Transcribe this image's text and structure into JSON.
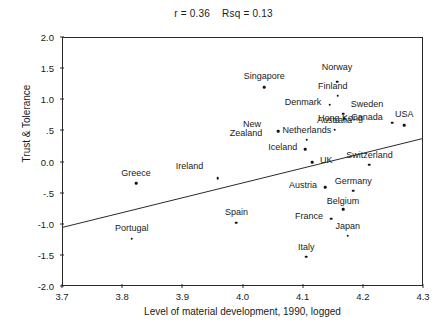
{
  "chart_data": {
    "type": "scatter",
    "title": "r = 0.36    Rsq = 0.13",
    "xlabel": "Level of material development, 1990, logged",
    "ylabel": "Trust & Tolerance",
    "xlim": [
      3.7,
      4.3
    ],
    "ylim": [
      -2.0,
      2.0
    ],
    "xticks": [
      "3.7",
      "3.8",
      "3.9",
      "4.0",
      "4.1",
      "4.2",
      "4.3"
    ],
    "xtick_values": [
      3.7,
      3.8,
      3.9,
      4.0,
      4.1,
      4.2,
      4.3
    ],
    "yticks": [
      "2.0",
      "1.5",
      "1.0",
      ".5",
      "0.0",
      "-.5",
      "-1.0",
      "-1.5",
      "-2.0"
    ],
    "ytick_values": [
      2.0,
      1.5,
      1.0,
      0.5,
      0.0,
      -0.5,
      -1.0,
      -1.5,
      -2.0
    ],
    "grid": false,
    "legend": "none",
    "statistics": {
      "r": "0.36",
      "rsq": "0.13"
    },
    "fit_line": {
      "type": "linear",
      "x": [
        3.7,
        4.3
      ],
      "y": [
        -1.06,
        0.37
      ]
    },
    "points": [
      {
        "label": "Norway",
        "x": 4.157,
        "y": 1.28,
        "lx": 4.157,
        "ly": 1.52,
        "anchor": "center"
      },
      {
        "label": "Singapore",
        "x": 4.036,
        "y": 1.19,
        "lx": 4.036,
        "ly": 1.37,
        "anchor": "center"
      },
      {
        "label": "Finland",
        "x": 4.158,
        "y": 1.06,
        "lx": 4.15,
        "ly": 1.22,
        "anchor": "center"
      },
      {
        "label": "Denmark",
        "x": 4.145,
        "y": 0.91,
        "lx": 4.131,
        "ly": 0.95,
        "anchor": "end"
      },
      {
        "label": "Sweden",
        "x": 4.167,
        "y": 0.77,
        "lx": 4.18,
        "ly": 0.92,
        "anchor": "start"
      },
      {
        "label": "Hong Kong",
        "x": 4.169,
        "y": 0.69,
        "lx": 4.163,
        "ly": 0.7,
        "anchor": "center"
      },
      {
        "label": "USA",
        "x": 4.269,
        "y": 0.58,
        "lx": 4.269,
        "ly": 0.76,
        "anchor": "center"
      },
      {
        "label": "Canada",
        "x": 4.249,
        "y": 0.62,
        "lx": 4.233,
        "ly": 0.72,
        "anchor": "end"
      },
      {
        "label": "Australia",
        "x": 4.153,
        "y": 0.51,
        "lx": 4.153,
        "ly": 0.66,
        "anchor": "center"
      },
      {
        "label": "Netherlands",
        "x": 4.107,
        "y": 0.35,
        "lx": 4.107,
        "ly": 0.5,
        "anchor": "center"
      },
      {
        "label": "New",
        "x": null,
        "y": null,
        "lx": 4.016,
        "ly": 0.6,
        "anchor": "center"
      },
      {
        "label": "Zealand",
        "x": 4.059,
        "y": 0.49,
        "lx": 4.033,
        "ly": 0.46,
        "anchor": "end"
      },
      {
        "label": "Iceland",
        "x": 4.104,
        "y": 0.2,
        "lx": 4.091,
        "ly": 0.23,
        "anchor": "end"
      },
      {
        "label": "Switzerland",
        "x": 4.211,
        "y": -0.05,
        "lx": 4.211,
        "ly": 0.1,
        "anchor": "center"
      },
      {
        "label": "UK",
        "x": 4.116,
        "y": -0.01,
        "lx": 4.129,
        "ly": 0.02,
        "anchor": "start"
      },
      {
        "label": "Greece",
        "x": 3.823,
        "y": -0.35,
        "lx": 3.823,
        "ly": -0.18,
        "anchor": "center"
      },
      {
        "label": "Ireland",
        "x": 3.959,
        "y": -0.27,
        "lx": 3.912,
        "ly": -0.08,
        "anchor": "center"
      },
      {
        "label": "Austria",
        "x": 4.137,
        "y": -0.41,
        "lx": 4.124,
        "ly": -0.38,
        "anchor": "end"
      },
      {
        "label": "Germany",
        "x": 4.184,
        "y": -0.47,
        "lx": 4.184,
        "ly": -0.32,
        "anchor": "center"
      },
      {
        "label": "Belgium",
        "x": 4.167,
        "y": -0.77,
        "lx": 4.167,
        "ly": -0.63,
        "anchor": "center"
      },
      {
        "label": "France",
        "x": 4.147,
        "y": -0.92,
        "lx": 4.134,
        "ly": -0.88,
        "anchor": "end"
      },
      {
        "label": "Spain",
        "x": 3.99,
        "y": -0.98,
        "lx": 3.99,
        "ly": -0.81,
        "anchor": "center"
      },
      {
        "label": "Japan",
        "x": 4.175,
        "y": -1.19,
        "lx": 4.175,
        "ly": -1.03,
        "anchor": "center"
      },
      {
        "label": "Portugal",
        "x": 3.816,
        "y": -1.24,
        "lx": 3.816,
        "ly": -1.07,
        "anchor": "center"
      },
      {
        "label": "Italy",
        "x": 4.106,
        "y": -1.53,
        "lx": 4.106,
        "ly": -1.38,
        "anchor": "center"
      }
    ]
  }
}
